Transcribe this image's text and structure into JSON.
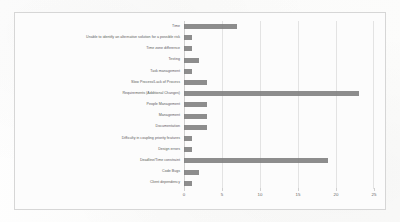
{
  "chart_data": {
    "type": "bar",
    "orientation": "horizontal",
    "title": "",
    "subtitle": "",
    "xlabel": "",
    "ylabel": "",
    "xlim": [
      0,
      25
    ],
    "xticks": [
      "0",
      "5",
      "10",
      "15",
      "20",
      "25"
    ],
    "grid": true,
    "legend": false,
    "bar_color": "#7d7d7d",
    "plot_background": "#fcfcfc",
    "border_color": "#d6d6d6",
    "gridline_color": "#e3e3e3",
    "categories": [
      "Time",
      "Unable to identify an alternative solution for a possible risk",
      "Time zone difference",
      "Testing",
      "Task management",
      "Slow Process/Lack of Process",
      "Requirements (Additional Changes)",
      "People Management",
      "Management",
      "Documentation",
      "Difficulty in coupling priority features",
      "Design errors",
      "Deadline/Time constraint",
      "Code Bugs",
      "Client dependency"
    ],
    "values": [
      7,
      1,
      1,
      2,
      1,
      3,
      23,
      3,
      3,
      3,
      1,
      1,
      19,
      2,
      1
    ]
  }
}
